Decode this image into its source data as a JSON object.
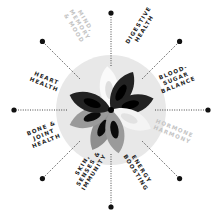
{
  "diagram": {
    "center": {
      "x": 111,
      "y": 110
    },
    "circle_radius": 55,
    "dot_radius": 97,
    "colors": {
      "background": "#ffffff",
      "circle": "#e8e8e8",
      "dark_petal": "#1c1c1c",
      "mid_petal": "#8c8c8c",
      "light_petal": "#ffffff",
      "dot": "#111111",
      "line": "#333333",
      "label": "#222222",
      "faded_label": "#c4c4c4"
    },
    "spokes": [
      {
        "id": "top",
        "angle": -90,
        "label": null
      },
      {
        "id": "digestive",
        "angle": -45,
        "label": null
      },
      {
        "id": "right",
        "angle": 0,
        "label": null
      },
      {
        "id": "hormone",
        "angle": 45,
        "label": null
      },
      {
        "id": "bottom",
        "angle": 90,
        "label": null
      },
      {
        "id": "skin",
        "angle": 135,
        "label": null
      },
      {
        "id": "left",
        "angle": 180,
        "label": null
      },
      {
        "id": "heart",
        "angle": -135,
        "label": null
      }
    ],
    "labels": [
      {
        "name": "mind-memory-mood",
        "lines": [
          "MIND,",
          "MEMORY",
          "& MOOD"
        ],
        "faded": true
      },
      {
        "name": "digestive-health",
        "lines": [
          "DIGESTIVE",
          "HEALTH"
        ],
        "faded": false
      },
      {
        "name": "blood-sugar-balance",
        "lines": [
          "BLOOD-",
          "SUGAR",
          "BALANCE"
        ],
        "faded": false
      },
      {
        "name": "hormone-harmony",
        "lines": [
          "HORMONE",
          "HARMONY"
        ],
        "faded": true
      },
      {
        "name": "energy-boosting",
        "lines": [
          "ENERGY",
          "BOOSTING"
        ],
        "faded": false
      },
      {
        "name": "skin-senses-immunity",
        "lines": [
          "SKIN,",
          "SENSES &",
          "IMMUNITY"
        ],
        "faded": false
      },
      {
        "name": "bone-joint-health",
        "lines": [
          "BONE &",
          "JOINT",
          "HEALTH"
        ],
        "faded": false
      },
      {
        "name": "heart-health",
        "lines": [
          "HEART",
          "HEALTH"
        ],
        "faded": false
      }
    ]
  }
}
